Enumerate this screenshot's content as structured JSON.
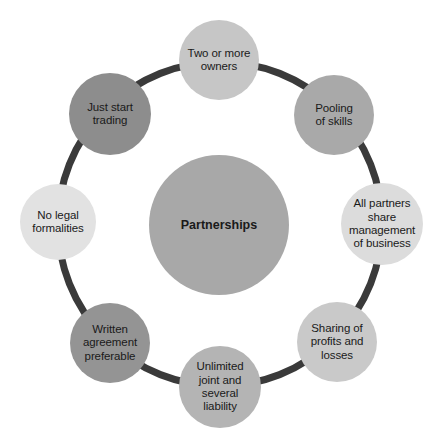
{
  "diagram": {
    "type": "cycle-diagram",
    "title": "Partnerships",
    "ring_color": "#3a3a3a",
    "background": "#ffffff",
    "center": {
      "label": "Partnerships",
      "color": "#a8a8a8",
      "cx": 219,
      "cy": 225,
      "r": 70
    },
    "nodes": [
      {
        "id": "two-or-more-owners",
        "label": "Two or more\nowners",
        "color": "#c6c6c6",
        "cx": 219,
        "cy": 60,
        "r": 40,
        "angle_deg": 270
      },
      {
        "id": "pooling-of-skills",
        "label": "Pooling\nof skills",
        "color": "#a9a9a9",
        "cx": 334,
        "cy": 115,
        "r": 40,
        "angle_deg": 315
      },
      {
        "id": "all-partners-share-management",
        "label": "All partners\nshare\nmanagement\nof business",
        "color": "#dcdcdc",
        "cx": 382,
        "cy": 224,
        "r": 41,
        "angle_deg": 0
      },
      {
        "id": "sharing-of-profits-and-losses",
        "label": "Sharing of\nprofits and\nlosses",
        "color": "#c9c9c9",
        "cx": 337,
        "cy": 342,
        "r": 40,
        "angle_deg": 45
      },
      {
        "id": "unlimited-joint-and-several-liability",
        "label": "Unlimited\njoint and\nseveral\nliability",
        "color": "#b4b4b4",
        "cx": 220,
        "cy": 387,
        "r": 41,
        "angle_deg": 90
      },
      {
        "id": "written-agreement-preferable",
        "label": "Written\nagreement\npreferable",
        "color": "#949494",
        "cx": 110,
        "cy": 343,
        "r": 40,
        "angle_deg": 135
      },
      {
        "id": "no-legal-formalities",
        "label": "No legal\nformalities",
        "color": "#e2e2e2",
        "cx": 58,
        "cy": 222,
        "r": 38,
        "angle_deg": 180
      },
      {
        "id": "just-start-trading",
        "label": "Just start\ntrading",
        "color": "#8d8d8d",
        "cx": 110,
        "cy": 114,
        "r": 41,
        "angle_deg": 225
      }
    ]
  }
}
